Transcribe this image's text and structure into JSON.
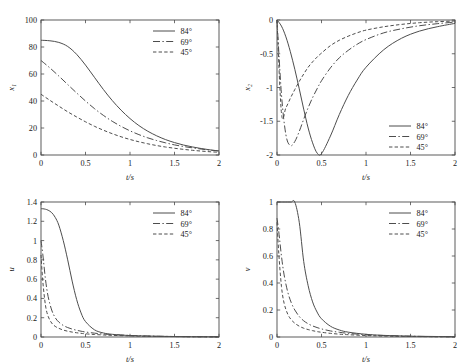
{
  "figure": {
    "name": "four-panel-time-response-figure",
    "background": "#ffffff",
    "line_color": "#4d4d4d",
    "axis_color": "#4a4a4a"
  },
  "legend": {
    "entries": [
      {
        "label": "84°",
        "style": "solid"
      },
      {
        "label": "69°",
        "style": "dashdot"
      },
      {
        "label": "45°",
        "style": "dashed"
      }
    ]
  },
  "chart_data": [
    {
      "type": "line",
      "panel": "top-left",
      "title": "",
      "xlabel": "t/s",
      "ylabel": "x₁",
      "xlim": [
        0,
        2
      ],
      "ylim": [
        0,
        100
      ],
      "xticks": [
        0,
        0.5,
        1,
        1.5,
        2
      ],
      "xticklabels": [
        "0",
        "0.5",
        "1",
        "1.5",
        "2"
      ],
      "yticks": [
        0,
        20,
        40,
        60,
        80,
        100
      ],
      "yticklabels": [
        "0",
        "20",
        "40",
        "60",
        "80",
        "100"
      ],
      "grid": false,
      "legend_position": "upper-right",
      "x": [
        0,
        0.1,
        0.2,
        0.3,
        0.4,
        0.5,
        0.6,
        0.7,
        0.8,
        0.9,
        1.0,
        1.1,
        1.2,
        1.3,
        1.4,
        1.5,
        1.6,
        1.7,
        1.8,
        1.9,
        2.0
      ],
      "series": [
        {
          "name": "84°",
          "style": "solid",
          "values": [
            85,
            84.6,
            83.4,
            80.4,
            74.6,
            66.6,
            57.6,
            48.6,
            40.4,
            33.2,
            27.0,
            21.8,
            17.6,
            14.2,
            11.4,
            9.2,
            7.4,
            6.0,
            4.8,
            3.8,
            3.0
          ]
        },
        {
          "name": "69°",
          "style": "dashdot",
          "values": [
            70,
            64.5,
            58.5,
            52.2,
            46.0,
            40.0,
            34.4,
            29.4,
            25.0,
            21.2,
            17.9,
            15.1,
            12.7,
            10.7,
            9.0,
            7.5,
            6.3,
            5.3,
            4.4,
            3.6,
            3.0
          ]
        },
        {
          "name": "45°",
          "style": "dashed",
          "values": [
            45,
            40.5,
            36.2,
            32.0,
            28.2,
            24.6,
            21.3,
            18.4,
            15.8,
            13.5,
            11.5,
            9.8,
            8.3,
            7.0,
            5.9,
            5.0,
            4.2,
            3.5,
            2.9,
            2.4,
            2.0
          ]
        }
      ]
    },
    {
      "type": "line",
      "panel": "top-right",
      "title": "",
      "xlabel": "t/s",
      "ylabel": "x₂",
      "xlim": [
        0,
        2
      ],
      "ylim": [
        -2,
        0
      ],
      "xticks": [
        0,
        0.5,
        1,
        1.5,
        2
      ],
      "xticklabels": [
        "0",
        "0.5",
        "1",
        "1.5",
        "2"
      ],
      "yticks": [
        -2,
        -1.5,
        -1,
        -0.5,
        0
      ],
      "yticklabels": [
        "-2",
        "-1.5",
        "-1",
        "-0.5",
        "0"
      ],
      "grid": false,
      "legend_position": "lower-right",
      "x": [
        0,
        0.05,
        0.1,
        0.15,
        0.2,
        0.25,
        0.3,
        0.35,
        0.4,
        0.45,
        0.5,
        0.6,
        0.7,
        0.8,
        0.9,
        1.0,
        1.2,
        1.4,
        1.6,
        1.8,
        2.0
      ],
      "series": [
        {
          "name": "84°",
          "style": "solid",
          "values": [
            0,
            -0.09,
            -0.25,
            -0.47,
            -0.73,
            -1.02,
            -1.32,
            -1.6,
            -1.82,
            -1.97,
            -1.98,
            -1.72,
            -1.4,
            -1.12,
            -0.89,
            -0.7,
            -0.44,
            -0.27,
            -0.165,
            -0.1,
            -0.05
          ]
        },
        {
          "name": "69°",
          "style": "dashdot",
          "values": [
            0,
            -1.1,
            -1.7,
            -1.86,
            -1.8,
            -1.65,
            -1.47,
            -1.3,
            -1.15,
            -1.02,
            -0.9,
            -0.71,
            -0.56,
            -0.45,
            -0.36,
            -0.29,
            -0.19,
            -0.13,
            -0.085,
            -0.055,
            -0.03
          ]
        },
        {
          "name": "45°",
          "style": "dashed",
          "values": [
            0,
            -1.38,
            -1.3,
            -1.16,
            -1.03,
            -0.91,
            -0.8,
            -0.7,
            -0.62,
            -0.55,
            -0.49,
            -0.38,
            -0.3,
            -0.24,
            -0.19,
            -0.15,
            -0.1,
            -0.065,
            -0.04,
            -0.025,
            -0.015
          ]
        }
      ]
    },
    {
      "type": "line",
      "panel": "bottom-left",
      "title": "",
      "xlabel": "t/s",
      "ylabel": "u",
      "xlim": [
        0,
        2
      ],
      "ylim": [
        0,
        1.4
      ],
      "xticks": [
        0,
        0.5,
        1,
        1.5,
        2
      ],
      "xticklabels": [
        "0",
        "0.5",
        "1",
        "1.5",
        "2"
      ],
      "yticks": [
        0,
        0.2,
        0.4,
        0.6,
        0.8,
        1,
        1.2,
        1.4
      ],
      "yticklabels": [
        "0",
        "0.2",
        "0.4",
        "0.6",
        "0.8",
        "1",
        "1.2",
        "1.4"
      ],
      "grid": false,
      "legend_position": "upper-right",
      "x": [
        0,
        0.02,
        0.05,
        0.08,
        0.12,
        0.16,
        0.2,
        0.25,
        0.3,
        0.35,
        0.4,
        0.45,
        0.5,
        0.6,
        0.7,
        0.8,
        1.0,
        1.2,
        1.5,
        1.75,
        2.0
      ],
      "series": [
        {
          "name": "84°",
          "style": "solid",
          "values": [
            1.33,
            1.33,
            1.325,
            1.315,
            1.29,
            1.24,
            1.16,
            1.0,
            0.8,
            0.58,
            0.39,
            0.25,
            0.16,
            0.075,
            0.042,
            0.028,
            0.015,
            0.01,
            0.005,
            0.003,
            0.002
          ]
        },
        {
          "name": "69°",
          "style": "dashdot",
          "values": [
            1.0,
            0.86,
            0.6,
            0.42,
            0.28,
            0.2,
            0.155,
            0.12,
            0.098,
            0.082,
            0.07,
            0.06,
            0.052,
            0.04,
            0.031,
            0.025,
            0.016,
            0.01,
            0.005,
            0.003,
            0.002
          ]
        },
        {
          "name": "45°",
          "style": "dashed",
          "values": [
            0.85,
            0.58,
            0.33,
            0.215,
            0.145,
            0.11,
            0.09,
            0.072,
            0.06,
            0.051,
            0.044,
            0.038,
            0.033,
            0.026,
            0.021,
            0.017,
            0.011,
            0.007,
            0.004,
            0.002,
            0.001
          ]
        }
      ]
    },
    {
      "type": "line",
      "panel": "bottom-right",
      "title": "",
      "xlabel": "t/s",
      "ylabel": "v",
      "xlim": [
        0,
        2
      ],
      "ylim": [
        0,
        1
      ],
      "xticks": [
        0,
        0.5,
        1,
        1.5,
        2
      ],
      "xticklabels": [
        "0",
        "0.5",
        "1",
        "1.5",
        "2"
      ],
      "yticks": [
        0,
        0.2,
        0.4,
        0.6,
        0.8,
        1
      ],
      "yticklabels": [
        "0",
        "0.2",
        "0.4",
        "0.6",
        "0.8",
        "1"
      ],
      "grid": false,
      "legend_position": "upper-right",
      "x": [
        0,
        0.02,
        0.05,
        0.08,
        0.12,
        0.16,
        0.2,
        0.25,
        0.3,
        0.35,
        0.4,
        0.45,
        0.5,
        0.6,
        0.7,
        0.8,
        1.0,
        1.2,
        1.5,
        1.75,
        2.0
      ],
      "series": [
        {
          "name": "84°",
          "style": "solid",
          "values": [
            1.0,
            1.0,
            1.0,
            1.0,
            1.0,
            1.0,
            1.0,
            0.85,
            0.56,
            0.38,
            0.26,
            0.185,
            0.135,
            0.08,
            0.052,
            0.036,
            0.02,
            0.012,
            0.006,
            0.004,
            0.002
          ]
        },
        {
          "name": "69°",
          "style": "dashdot",
          "values": [
            0.88,
            0.78,
            0.6,
            0.46,
            0.335,
            0.255,
            0.2,
            0.152,
            0.12,
            0.098,
            0.082,
            0.07,
            0.06,
            0.045,
            0.035,
            0.027,
            0.017,
            0.011,
            0.006,
            0.003,
            0.002
          ]
        },
        {
          "name": "45°",
          "style": "dashed",
          "values": [
            0.85,
            0.62,
            0.375,
            0.25,
            0.17,
            0.128,
            0.102,
            0.08,
            0.065,
            0.055,
            0.047,
            0.04,
            0.035,
            0.027,
            0.021,
            0.017,
            0.011,
            0.007,
            0.004,
            0.002,
            0.001
          ]
        }
      ]
    }
  ]
}
